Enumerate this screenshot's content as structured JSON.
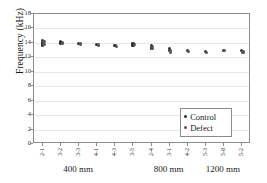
{
  "chart_data": {
    "type": "scatter",
    "title": "",
    "xlabel": "",
    "ylabel": "Frequency (kHz)",
    "ylim": [
      0,
      18
    ],
    "yticks": [
      0,
      2,
      4,
      6,
      8,
      10,
      12,
      14,
      16,
      18
    ],
    "grid": true,
    "legend_position": "lower-right",
    "categories": [
      "2-1",
      "3-2",
      "3-3",
      "4-1",
      "4-3",
      "3-5",
      "2-4",
      "3-1",
      "4-2",
      "5-3",
      "5-8",
      "5-2"
    ],
    "group_labels": [
      "400 mm",
      "800 mm",
      "1200 mm"
    ],
    "series": [
      {
        "name": "Control",
        "color": "#2e2e2e",
        "points": [
          {
            "category": "2-1",
            "values": [
              14.3,
              14.1,
              13.9,
              13.7
            ]
          },
          {
            "category": "3-2",
            "values": [
              14.2,
              14.0,
              13.9
            ]
          },
          {
            "category": "3-3",
            "values": [
              13.9
            ]
          },
          {
            "category": "4-1",
            "values": [
              13.8
            ]
          },
          {
            "category": "4-3",
            "values": [
              13.6
            ]
          },
          {
            "category": "3-5",
            "values": [
              13.9,
              13.7
            ]
          },
          {
            "category": "2-4",
            "values": [
              13.6,
              13.3
            ]
          },
          {
            "category": "3-1",
            "values": [
              13.2,
              12.9
            ]
          },
          {
            "category": "4-2",
            "values": [
              13.0
            ]
          },
          {
            "category": "5-3",
            "values": [
              12.8
            ]
          },
          {
            "category": "5-8",
            "values": [
              13.0
            ]
          },
          {
            "category": "5-2",
            "values": [
              12.9
            ]
          }
        ]
      },
      {
        "name": "Defect",
        "color": "#575757",
        "points": [
          {
            "category": "2-1",
            "values": [
              14.2,
              13.8
            ]
          },
          {
            "category": "3-2",
            "values": [
              14.1,
              13.9
            ]
          },
          {
            "category": "3-3",
            "values": [
              13.85
            ]
          },
          {
            "category": "4-1",
            "values": [
              13.7
            ]
          },
          {
            "category": "4-3",
            "values": [
              13.55
            ]
          },
          {
            "category": "3-5",
            "values": [
              13.75
            ]
          },
          {
            "category": "2-4",
            "values": [
              13.45,
              13.2
            ]
          },
          {
            "category": "3-1",
            "values": [
              13.0,
              12.7
            ]
          },
          {
            "category": "4-2",
            "values": [
              12.85
            ]
          },
          {
            "category": "5-3",
            "values": [
              12.7
            ]
          },
          {
            "category": "5-8",
            "values": [
              12.9
            ]
          },
          {
            "category": "5-2",
            "values": [
              12.75
            ]
          }
        ]
      }
    ]
  },
  "legend": {
    "entries": [
      {
        "label": "Control",
        "marker": "control"
      },
      {
        "label": "Defect",
        "marker": "defect"
      }
    ]
  }
}
